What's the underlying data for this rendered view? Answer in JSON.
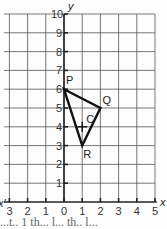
{
  "chart_data": {
    "type": "diagram",
    "title": "",
    "xlabel": "x",
    "ylabel": "y",
    "x_ticks": [
      "3",
      "2",
      "1",
      "0",
      "1",
      "2",
      "3",
      "4",
      "5"
    ],
    "y_ticks": [
      "1",
      "2",
      "3",
      "4",
      "5",
      "6",
      "7",
      "8",
      "9",
      "10"
    ],
    "xlim": [
      -3,
      5
    ],
    "ylim": [
      0,
      10
    ],
    "grid": true,
    "points": [
      {
        "label": "P",
        "x": 0,
        "y": 6
      },
      {
        "label": "Q",
        "x": 2,
        "y": 5
      },
      {
        "label": "R",
        "x": 1,
        "y": 3
      },
      {
        "label": "C",
        "x": 1,
        "y": 4,
        "marker": "+"
      }
    ],
    "shape": {
      "type": "triangle",
      "vertices": [
        "P",
        "Q",
        "R"
      ]
    }
  },
  "labels": {
    "x_axis": "x",
    "y_axis": "y",
    "x_axis_neg": "x'",
    "P": "P",
    "Q": "Q",
    "R": "R",
    "C": "C"
  },
  "caption_fragment": "...t.. 1 th... l... th.. l..."
}
